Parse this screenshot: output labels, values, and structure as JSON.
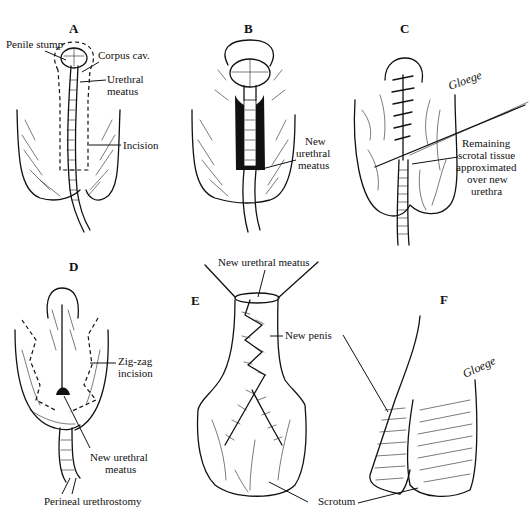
{
  "figure": {
    "panels": [
      {
        "id": "A",
        "letter": "A",
        "labels": {
          "penile_stump": "Penile stump",
          "corpus_cav": "Corpus cav.",
          "urethral_meatus_1": "Urethral",
          "urethral_meatus_2": "meatus",
          "incision": "Incision"
        }
      },
      {
        "id": "B",
        "letter": "B",
        "labels": {
          "new_meatus_1": "New",
          "new_meatus_2": "urethral",
          "new_meatus_3": "meatus"
        }
      },
      {
        "id": "C",
        "letter": "C",
        "labels": {
          "remaining_1": "Remaining",
          "remaining_2": "scrotal tissue",
          "remaining_3": "approximated",
          "remaining_4": "over new",
          "remaining_5": "urethra"
        },
        "signature": "Gloege"
      },
      {
        "id": "D",
        "letter": "D",
        "labels": {
          "zigzag_1": "Zig-zag",
          "zigzag_2": "incision",
          "new_meatus_1": "New urethral",
          "new_meatus_2": "meatus",
          "perineal": "Perineal urethrostomy"
        }
      },
      {
        "id": "E",
        "letter": "E",
        "labels": {
          "new_urethral_meatus": "New urethral meatus",
          "new_penis": "New penis"
        }
      },
      {
        "id": "F",
        "letter": "F",
        "labels": {},
        "signature": "Gloege"
      }
    ],
    "shared_labels": {
      "scrotum": "Scrotum"
    }
  }
}
